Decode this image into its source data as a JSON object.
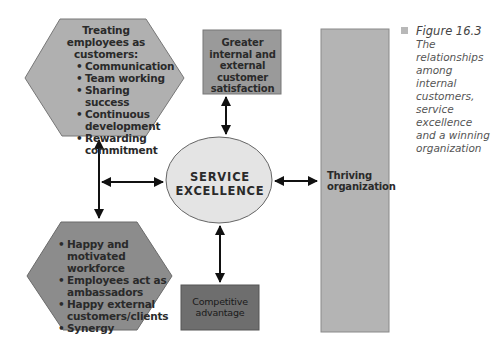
{
  "figure": {
    "label": "Figure 16.3",
    "description": "The relationships among internal customers, service excellence and a winning organization"
  },
  "colors": {
    "hexagon_top": "#b0b0b0",
    "hexagon_bottom": "#8c8c8c",
    "satisfaction_box": "#9a9a9a",
    "thriving_box": "#b4b4b4",
    "competitive_box": "#6e6e6e",
    "ellipse": "#e4e4e4",
    "arrows": "#111111",
    "caption_bullet": "#b8b8b8"
  },
  "nodes": {
    "treating_employees": {
      "title": "Treating employees as customers:",
      "items": [
        "Communication",
        "Team working",
        "Sharing success",
        "Continuous development",
        "Rewarding commitment"
      ]
    },
    "outcomes": {
      "items": [
        "Happy and motivated workforce",
        "Employees act as ambassadors",
        "Happy external customers/clients",
        "Synergy"
      ]
    },
    "satisfaction": {
      "label": "Greater internal and external customer satisfaction"
    },
    "service_excellence": {
      "line1": "SERVICE",
      "line2": "EXCELLENCE"
    },
    "thriving": {
      "label": "Thriving organization"
    },
    "competitive": {
      "label": "Competitive advantage"
    }
  },
  "connections": [
    {
      "from": "treating_employees",
      "to": "outcomes",
      "type": "double-arrow"
    },
    {
      "from": "left-connector",
      "to": "service_excellence",
      "type": "double-arrow"
    },
    {
      "from": "satisfaction",
      "to": "service_excellence",
      "type": "double-arrow"
    },
    {
      "from": "service_excellence",
      "to": "thriving",
      "type": "double-arrow"
    },
    {
      "from": "service_excellence",
      "to": "competitive",
      "type": "double-arrow"
    }
  ]
}
